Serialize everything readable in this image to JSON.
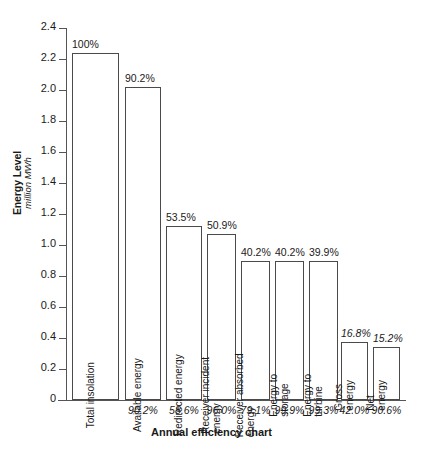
{
  "chart_data": {
    "type": "bar",
    "title": "",
    "xlabel": "Annual efficiency chart",
    "ylabel": "Energy Level",
    "ylabel_sub": "million MWh",
    "ylim": [
      0,
      2.4
    ],
    "grid": false,
    "legend": "none",
    "ytick_labels": [
      "2.4",
      "2.2",
      "2.0",
      "1.8",
      "1.6",
      "1.4",
      "1.2",
      "1.0",
      "0.8",
      "0.6",
      "0.4",
      "0.2",
      "0"
    ],
    "ytick_values": [
      2.4,
      2.2,
      2.0,
      1.8,
      1.6,
      1.4,
      1.2,
      1.0,
      0.8,
      0.6,
      0.4,
      0.2,
      0
    ],
    "categories": [
      "Total insolation",
      "Available energy",
      "Redirected energy",
      "Receiver incident energy",
      "Receiver absorbed energy",
      "Energy to storage",
      "Energy to turbine",
      "Gross energy",
      "Net energy"
    ],
    "values": [
      2.24,
      2.02,
      1.12,
      1.07,
      0.9,
      0.9,
      0.895,
      0.375,
      0.34
    ],
    "bar_top_labels": [
      "100%",
      "90.2%",
      "53.5%",
      "50.9%",
      "40.2%",
      "40.2%",
      "39.9%",
      "16.8%",
      "15.2%"
    ],
    "cumulative_percent": [
      100,
      90.2,
      53.5,
      50.9,
      40.2,
      40.2,
      39.9,
      16.8,
      15.2
    ],
    "stage_efficiency_labels": [
      "90.2%",
      "58.6%",
      "96.0%",
      "79.1%",
      "99.9%",
      "99.3%",
      "42.0%",
      "90.6%"
    ],
    "stage_efficiency_values": [
      90.2,
      58.6,
      96.0,
      79.1,
      99.9,
      99.3,
      42.0,
      90.6
    ],
    "bar_label_lines": [
      [
        "Total insolation"
      ],
      [
        "Available energy"
      ],
      [
        "Redirected energy"
      ],
      [
        "Receiver incident",
        "energy"
      ],
      [
        "Receiver absorbed",
        "energy"
      ],
      [
        "Energy to",
        "storage"
      ],
      [
        "Energy to",
        "turbine"
      ],
      [
        "Gross",
        "energy"
      ],
      [
        "Net",
        "energy"
      ]
    ],
    "colors": {
      "bar_fill": "#ffffff",
      "bar_stroke": "#4a4a4a",
      "axis": "#555555",
      "text": "#1a1a1a",
      "background": "#ffffff"
    }
  }
}
